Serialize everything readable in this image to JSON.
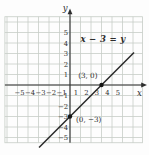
{
  "chart_data": {
    "type": "line",
    "title": "",
    "equation": "x − 3 = y",
    "xlabel": "x",
    "ylabel": "y",
    "xlim": [
      -6.2,
      6.9
    ],
    "ylim": [
      -5.5,
      6.5
    ],
    "x_ticks": [
      -5,
      -4,
      -3,
      -2,
      -1,
      1,
      2,
      3,
      4,
      5
    ],
    "y_ticks": [
      5,
      4,
      3,
      2,
      1,
      -1,
      -2,
      -3,
      -4,
      -5
    ],
    "grid": true,
    "series": [
      {
        "name": "x − 3 = y",
        "slope": 1,
        "intercept": -3,
        "x_range": [
          -2.95,
          6.1
        ]
      }
    ],
    "points": [
      {
        "x": 3,
        "y": 0,
        "label": "(3, 0)",
        "label_position": "above-left"
      },
      {
        "x": 0,
        "y": -3,
        "label": "(0, −3)",
        "label_position": "right"
      }
    ],
    "colors": {
      "grid": "#c6cdc6",
      "axis": "#2e2e2e",
      "line": "#2a2a2a",
      "point": "#151515",
      "text": "#2e2e2e",
      "background": "#fdfdfd"
    }
  }
}
